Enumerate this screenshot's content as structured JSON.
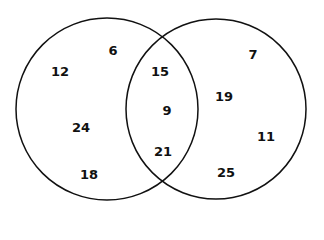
{
  "diagram": {
    "type": "venn",
    "stroke_color": "#111111",
    "background": "#ffffff",
    "circles": [
      {
        "name": "left-set",
        "cx": 107,
        "cy": 109,
        "r": 91
      },
      {
        "name": "right-set",
        "cx": 216,
        "cy": 109,
        "r": 90
      }
    ],
    "regions": {
      "left_only": [
        {
          "value": "6",
          "x": 113,
          "y": 50
        },
        {
          "value": "12",
          "x": 60,
          "y": 71
        },
        {
          "value": "24",
          "x": 81,
          "y": 127
        },
        {
          "value": "18",
          "x": 89,
          "y": 174
        }
      ],
      "intersection": [
        {
          "value": "15",
          "x": 160,
          "y": 71
        },
        {
          "value": "9",
          "x": 167,
          "y": 110
        },
        {
          "value": "21",
          "x": 163,
          "y": 151
        }
      ],
      "right_only": [
        {
          "value": "7",
          "x": 253,
          "y": 54
        },
        {
          "value": "19",
          "x": 224,
          "y": 96
        },
        {
          "value": "11",
          "x": 266,
          "y": 136
        },
        {
          "value": "25",
          "x": 226,
          "y": 172
        }
      ]
    }
  }
}
